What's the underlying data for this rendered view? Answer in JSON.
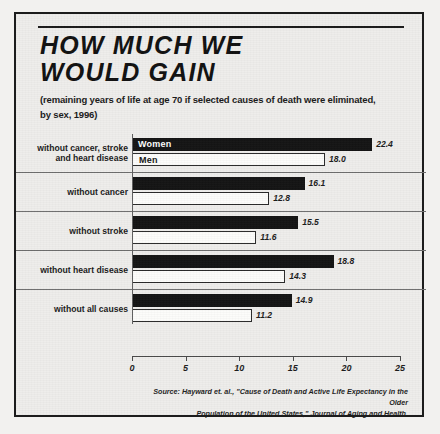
{
  "figure": {
    "title_lines": [
      "HOW MUCH WE",
      "WOULD GAIN"
    ],
    "subtitle_lines": [
      "(remaining years of life at age 70 if selected causes of death were eliminated,",
      "by sex, 1996)"
    ],
    "source_lines": [
      "Source:  Hayward et. al., \"Cause of Death and Active Life Expectancy in the Older",
      "Population of the United States,\" Journal of Aging and Health."
    ]
  },
  "chart_data": {
    "type": "bar",
    "orientation": "horizontal",
    "title": "HOW MUCH WE WOULD GAIN",
    "subtitle": "(remaining years of life at age 70 if selected causes of death were eliminated, by sex, 1996)",
    "xlabel": "",
    "ylabel": "",
    "xlim": [
      0,
      25
    ],
    "xticks": [
      0,
      5,
      10,
      15,
      20,
      25
    ],
    "xtick_labels": [
      "0",
      "5",
      "10",
      "15",
      "20",
      "25"
    ],
    "grid": false,
    "legend_position": "in-bar",
    "categories": [
      "without cancer, stroke and heart disease",
      "without cancer",
      "without stroke",
      "without heart disease",
      "without all causes"
    ],
    "category_lines": [
      [
        "without cancer, stroke",
        "and heart disease"
      ],
      [
        "without cancer"
      ],
      [
        "without stroke"
      ],
      [
        "without heart disease"
      ],
      [
        "without all causes"
      ]
    ],
    "series": [
      {
        "name": "Women",
        "color": "#141414",
        "values": [
          22.4,
          16.1,
          15.5,
          18.8,
          14.9
        ],
        "value_labels": [
          "22.4",
          "16.1",
          "15.5",
          "18.8",
          "14.9"
        ]
      },
      {
        "name": "Men",
        "color": "#fcfcfa",
        "values": [
          18.0,
          12.8,
          11.6,
          14.3,
          11.2
        ],
        "value_labels": [
          "18.0",
          "12.8",
          "11.6",
          "14.3",
          "11.2"
        ]
      }
    ]
  }
}
